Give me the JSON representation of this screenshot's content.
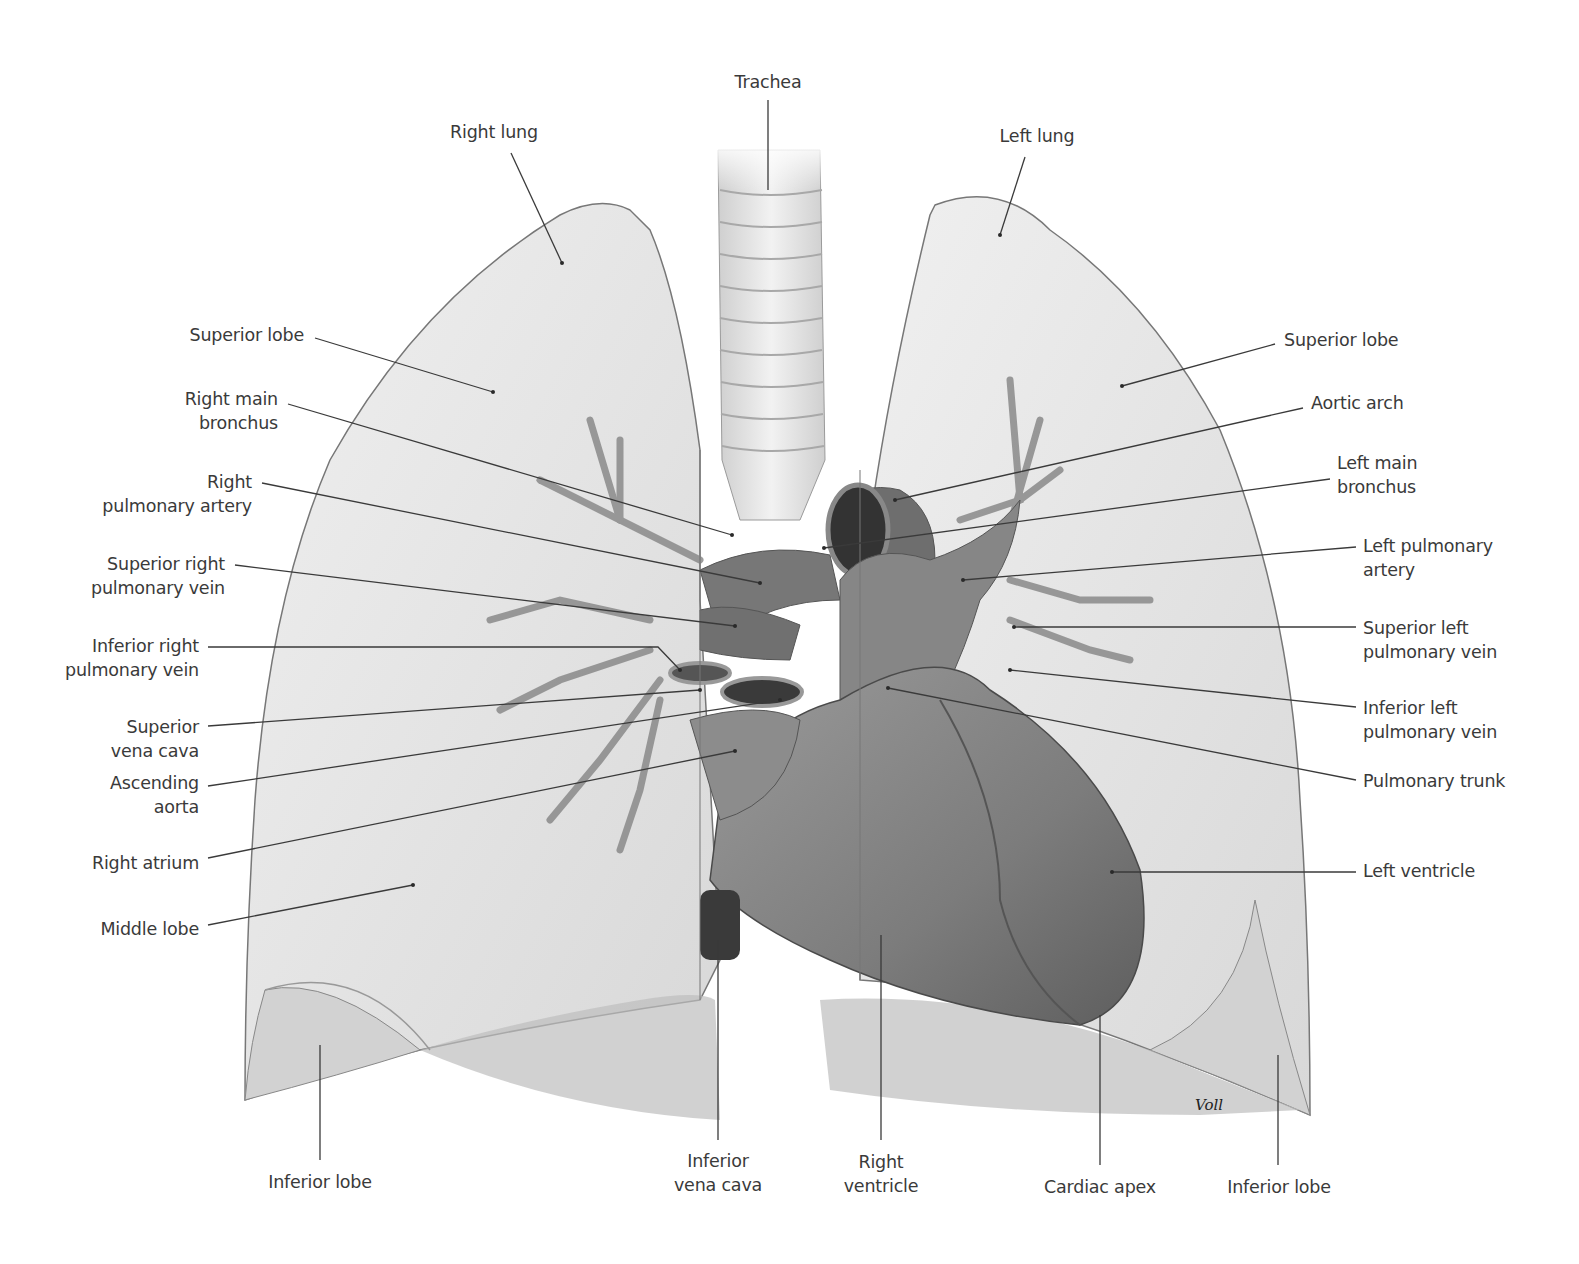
{
  "figure": {
    "signature": "Voll",
    "colors": {
      "background": "#ffffff",
      "lung_fill": "#e6e6e6",
      "lung_inferior_fill": "#cfcfcf",
      "heart_fill": "#8a8a8a",
      "vessel_fill": "#7a7a7a",
      "trachea_fill": "#e2e2e2",
      "leader_line": "#3a3a3a",
      "label_text": "#3a3a3a"
    }
  },
  "labels": {
    "trachea": "Trachea",
    "right_lung": "Right lung",
    "left_lung": "Left lung",
    "right_superior_lobe": "Superior lobe",
    "right_main_bronchus": "Right main\nbronchus",
    "right_pulmonary_artery": "Right\npulmonary artery",
    "superior_right_pulmonary_vein": "Superior right\npulmonary vein",
    "inferior_right_pulmonary_vein": "Inferior right\npulmonary vein",
    "superior_vena_cava": "Superior\nvena cava",
    "ascending_aorta": "Ascending\naorta",
    "right_atrium": "Right atrium",
    "middle_lobe": "Middle lobe",
    "right_inferior_lobe": "Inferior lobe",
    "inferior_vena_cava": "Inferior\nvena cava",
    "right_ventricle": "Right\nventricle",
    "cardiac_apex": "Cardiac apex",
    "left_inferior_lobe": "Inferior lobe",
    "left_superior_lobe": "Superior lobe",
    "aortic_arch": "Aortic arch",
    "left_main_bronchus": "Left main\nbronchus",
    "left_pulmonary_artery": "Left pulmonary\nartery",
    "superior_left_pulmonary_vein": "Superior left\npulmonary vein",
    "inferior_left_pulmonary_vein": "Inferior left\npulmonary vein",
    "pulmonary_trunk": "Pulmonary trunk",
    "left_ventricle": "Left ventricle"
  }
}
